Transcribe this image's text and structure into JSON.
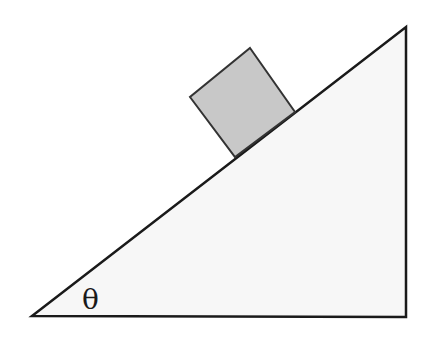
{
  "diagram": {
    "angle_label": "θ",
    "colors": {
      "background": "#ffffff",
      "incline_fill": "#f7f7f7",
      "incline_stroke": "#1a1a1a",
      "block_fill": "#c8c8c8",
      "block_stroke": "#333333"
    },
    "incline": {
      "vertices": [
        [
          32,
          316
        ],
        [
          406,
          317
        ],
        [
          406,
          27
        ]
      ]
    },
    "block": {
      "vertices": [
        [
          250,
          48
        ],
        [
          295,
          112
        ],
        [
          235,
          157
        ],
        [
          190,
          97
        ]
      ]
    }
  }
}
